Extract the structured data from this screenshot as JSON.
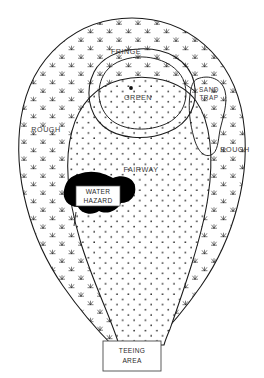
{
  "diagram": {
    "type": "golf-course-hole-schematic",
    "background_color": "#ffffff",
    "line_color": "#1a1a1a",
    "label_color": "#3a3a3a",
    "water_color": "#000000",
    "zones": {
      "rough_left": "ROUGH",
      "rough_right": "ROUGH",
      "fairway": "FAIRWAY",
      "fringe": "FRINGE",
      "green": "GREEN",
      "sand_trap_line1": "SAND",
      "sand_trap_line2": "TRAP",
      "water_hazard_line1": "WATER",
      "water_hazard_line2": "HAZARD",
      "teeing_area_line1": "TEEING",
      "teeing_area_line2": "AREA"
    },
    "markers": {
      "hole_pin": "hole-pin-dot",
      "rough_texture": "grass-tuft-mark",
      "fairway_texture": "stipple-dot"
    }
  }
}
